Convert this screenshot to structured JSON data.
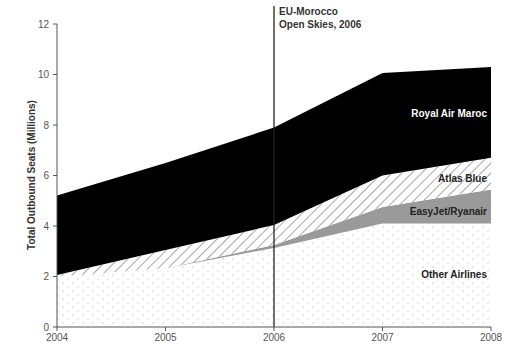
{
  "chart_data": {
    "type": "area",
    "stacked": true,
    "title": "",
    "xlabel": "",
    "ylabel": "Total Outbound Seats (Millions)",
    "x": [
      2004,
      2005,
      2006,
      2007,
      2008
    ],
    "x_tick_labels": [
      "2004",
      "2005",
      "2006",
      "2007",
      "2008"
    ],
    "ylim": [
      0,
      12
    ],
    "y_ticks": [
      0,
      2,
      4,
      6,
      8,
      10,
      12
    ],
    "y_tick_labels": [
      "0",
      "2",
      "4",
      "6",
      "8",
      "10",
      "12"
    ],
    "grid": false,
    "legend_position": "inline labels",
    "series": [
      {
        "name": "Other Airlines",
        "values": [
          2.0,
          2.33,
          3.13,
          4.1,
          4.1
        ],
        "fill": "dotted",
        "color": "#ffffff"
      },
      {
        "name": "EasyJet/Ryanair",
        "values": [
          0.0,
          0.0,
          0.12,
          0.65,
          1.35
        ],
        "fill": "solid",
        "color": "#9a9a9a"
      },
      {
        "name": "Atlas Blue",
        "values": [
          0.06,
          0.72,
          0.79,
          1.25,
          1.25
        ],
        "fill": "hatched",
        "color": "#ffffff"
      },
      {
        "name": "Royal Air Maroc",
        "values": [
          3.15,
          3.45,
          3.86,
          4.06,
          3.6
        ],
        "fill": "solid",
        "color": "#000000"
      }
    ],
    "totals": [
      5.21,
      6.5,
      7.9,
      10.06,
      10.3
    ],
    "annotations": [
      {
        "type": "vertical-line",
        "x": 2006,
        "label_lines": [
          "EU-Morocco",
          "Open Skies, 2006"
        ]
      }
    ]
  },
  "labels": {
    "ylabel": "Total Outbound Seats (Millions)",
    "annotation_line1": "EU-Morocco",
    "annotation_line2": "Open Skies, 2006",
    "royal_air_maroc": "Royal Air Maroc",
    "atlas_blue": "Atlas Blue",
    "easyjet_ryanair": "EasyJet/Ryanair",
    "other_airlines": "Other Airlines"
  }
}
